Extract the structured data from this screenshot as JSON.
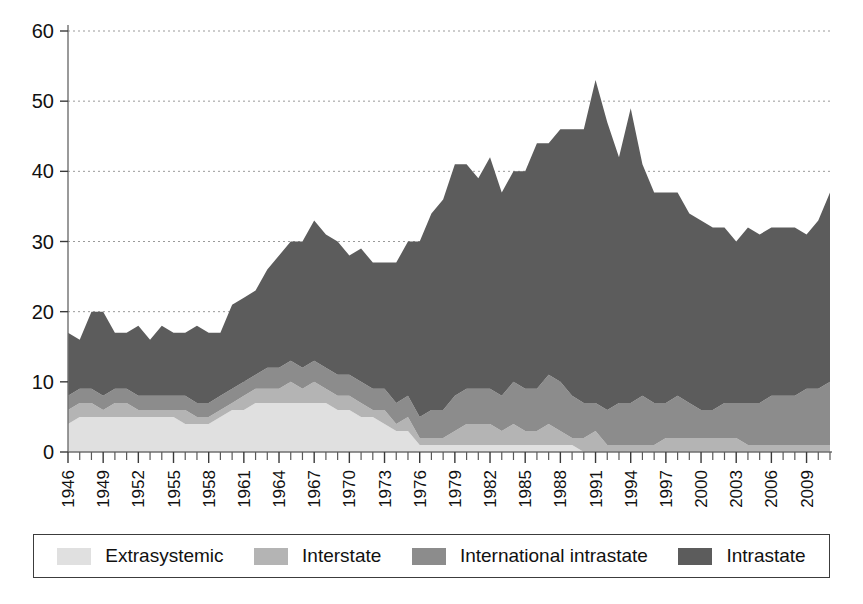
{
  "chart_data": {
    "type": "area",
    "stacked": true,
    "title": "",
    "subtitle": "",
    "xlabel": "",
    "ylabel": "",
    "ylim": [
      0,
      60
    ],
    "yticks": [
      0,
      10,
      20,
      30,
      40,
      50,
      60
    ],
    "grid": true,
    "legend_position": "bottom",
    "x_tick_label_rotation": -90,
    "x_tick_label_interval": 3,
    "x": [
      1946,
      1947,
      1948,
      1949,
      1950,
      1951,
      1952,
      1953,
      1954,
      1955,
      1956,
      1957,
      1958,
      1959,
      1960,
      1961,
      1962,
      1963,
      1964,
      1965,
      1966,
      1967,
      1968,
      1969,
      1970,
      1971,
      1972,
      1973,
      1974,
      1975,
      1976,
      1977,
      1978,
      1979,
      1980,
      1981,
      1982,
      1983,
      1984,
      1985,
      1986,
      1987,
      1988,
      1989,
      1990,
      1991,
      1992,
      1993,
      1994,
      1995,
      1996,
      1997,
      1998,
      1999,
      2000,
      2001,
      2002,
      2003,
      2004,
      2005,
      2006,
      2007,
      2008,
      2009,
      2010,
      2011
    ],
    "xtick_labels": [
      "1946",
      "1949",
      "1952",
      "1955",
      "1958",
      "1961",
      "1964",
      "1967",
      "1970",
      "1973",
      "1976",
      "1979",
      "1982",
      "1985",
      "1988",
      "1991",
      "1994",
      "1997",
      "2000",
      "2003",
      "2006",
      "2009"
    ],
    "series": [
      {
        "name": "Extrasystemic",
        "color": "#e0e0e0",
        "values": [
          4,
          5,
          5,
          5,
          5,
          5,
          5,
          5,
          5,
          5,
          4,
          4,
          4,
          5,
          6,
          6,
          7,
          7,
          7,
          7,
          7,
          7,
          7,
          6,
          6,
          5,
          5,
          4,
          3,
          3,
          1,
          1,
          1,
          1,
          1,
          1,
          1,
          1,
          1,
          1,
          1,
          1,
          1,
          1,
          0,
          0,
          0,
          0,
          0,
          0,
          0,
          0,
          0,
          0,
          0,
          0,
          0,
          0,
          0,
          0,
          0,
          0,
          0,
          0,
          0,
          0
        ]
      },
      {
        "name": "Interstate",
        "color": "#b4b4b4",
        "values": [
          2,
          2,
          2,
          1,
          2,
          2,
          1,
          1,
          1,
          1,
          2,
          1,
          1,
          1,
          1,
          2,
          2,
          2,
          2,
          3,
          2,
          3,
          2,
          2,
          2,
          2,
          1,
          2,
          1,
          2,
          1,
          1,
          1,
          2,
          3,
          3,
          3,
          2,
          3,
          2,
          2,
          3,
          2,
          1,
          2,
          3,
          1,
          1,
          1,
          1,
          1,
          2,
          2,
          2,
          2,
          2,
          2,
          2,
          1,
          1,
          1,
          1,
          1,
          1,
          1,
          1
        ]
      },
      {
        "name": "International intrastate",
        "color": "#8c8c8c",
        "values": [
          2,
          2,
          2,
          2,
          2,
          2,
          2,
          2,
          2,
          2,
          2,
          2,
          2,
          2,
          2,
          2,
          2,
          3,
          3,
          3,
          3,
          3,
          3,
          3,
          3,
          3,
          3,
          3,
          3,
          3,
          3,
          4,
          4,
          5,
          5,
          5,
          5,
          5,
          6,
          6,
          6,
          7,
          7,
          6,
          5,
          4,
          5,
          6,
          6,
          7,
          6,
          5,
          6,
          5,
          4,
          4,
          5,
          5,
          6,
          6,
          7,
          7,
          7,
          8,
          8,
          9
        ]
      },
      {
        "name": "Intrastate",
        "color": "#5c5c5c",
        "values": [
          9,
          7,
          11,
          12,
          8,
          8,
          10,
          8,
          10,
          9,
          9,
          11,
          10,
          9,
          12,
          12,
          12,
          14,
          16,
          17,
          18,
          20,
          19,
          19,
          17,
          19,
          18,
          18,
          20,
          22,
          25,
          28,
          30,
          33,
          32,
          30,
          33,
          29,
          30,
          31,
          35,
          33,
          36,
          38,
          39,
          46,
          41,
          35,
          42,
          33,
          30,
          30,
          29,
          27,
          27,
          26,
          25,
          23,
          25,
          24,
          24,
          24,
          24,
          22,
          24,
          27
        ]
      }
    ],
    "legend": [
      {
        "label": "Extrasystemic",
        "color": "#e0e0e0"
      },
      {
        "label": "Interstate",
        "color": "#b4b4b4"
      },
      {
        "label": "International intrastate",
        "color": "#8c8c8c"
      },
      {
        "label": "Intrastate",
        "color": "#5c5c5c"
      }
    ],
    "totals": [
      17,
      16,
      20,
      20,
      17,
      17,
      18,
      16,
      18,
      17,
      17,
      18,
      17,
      17,
      21,
      22,
      23,
      26,
      28,
      30,
      30,
      33,
      31,
      30,
      28,
      29,
      27,
      27,
      27,
      30,
      30,
      34,
      36,
      41,
      41,
      39,
      42,
      37,
      40,
      40,
      44,
      44,
      46,
      46,
      46,
      53,
      47,
      42,
      49,
      41,
      37,
      37,
      37,
      34,
      33,
      32,
      32,
      30,
      32,
      31,
      32,
      32,
      32,
      31,
      33,
      37
    ]
  },
  "axes": {
    "y_axis_name": "conflict-count-axis",
    "x_axis_name": "year-axis"
  }
}
